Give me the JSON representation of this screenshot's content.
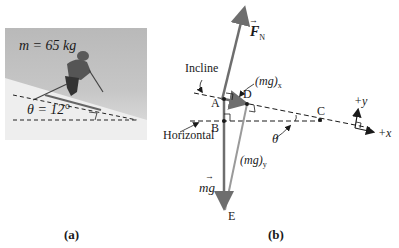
{
  "panel_a": {
    "mass_label": "m = 65 kg",
    "angle_label": "θ = 12°",
    "caption": "(a)"
  },
  "panel_b": {
    "caption": "(b)",
    "labels": {
      "normal_force": "F",
      "normal_force_sub": "N",
      "incline": "Incline",
      "horizontal": "Horizontal",
      "mg_x": "(mg)",
      "mg_x_sub": "x",
      "mg_y": "(mg)",
      "mg_y_sub": "y",
      "mg": "mg",
      "theta": "θ",
      "plus_y": "+y",
      "plus_x": "+x"
    },
    "points": {
      "A": "A",
      "B": "B",
      "C": "C",
      "D": "D",
      "E": "E"
    }
  },
  "colors": {
    "force_arrow": "#6e6e6e",
    "component_line": "#9a9a9a",
    "ink": "#1a1a1a"
  }
}
